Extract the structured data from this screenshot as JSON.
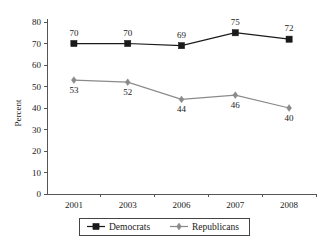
{
  "chart_data": {
    "type": "line",
    "title": "",
    "xlabel": "",
    "ylabel": "Percent",
    "categories": [
      "2001",
      "2003",
      "2006",
      "2007",
      "2008"
    ],
    "ylim": [
      0,
      80
    ],
    "yticks": [
      0,
      10,
      20,
      30,
      40,
      50,
      60,
      70,
      80
    ],
    "ytick_labels": [
      "0",
      "10",
      "20",
      "30",
      "40",
      "50",
      "60",
      "70",
      "80"
    ],
    "grid": false,
    "legend_position": "bottom",
    "series": [
      {
        "name": "Democrats",
        "values": [
          70,
          70,
          69,
          75,
          72
        ],
        "labels": [
          "70",
          "70",
          "69",
          "75",
          "72"
        ],
        "color": "#1a1a1a",
        "marker": "square",
        "label_position": "above"
      },
      {
        "name": "Republicans",
        "values": [
          53,
          52,
          44,
          46,
          40
        ],
        "labels": [
          "53",
          "52",
          "44",
          "46",
          "40"
        ],
        "color": "#8a8a8a",
        "marker": "diamond",
        "label_position": "below"
      }
    ]
  },
  "legend": {
    "items": [
      {
        "label": "Democrats",
        "color": "#1a1a1a",
        "marker": "square"
      },
      {
        "label": "Republicans",
        "color": "#8a8a8a",
        "marker": "diamond"
      }
    ]
  },
  "colors": {
    "democrats": "#1a1a1a",
    "republicans": "#8a8a8a",
    "axis": "#555555",
    "background": "#ffffff"
  }
}
